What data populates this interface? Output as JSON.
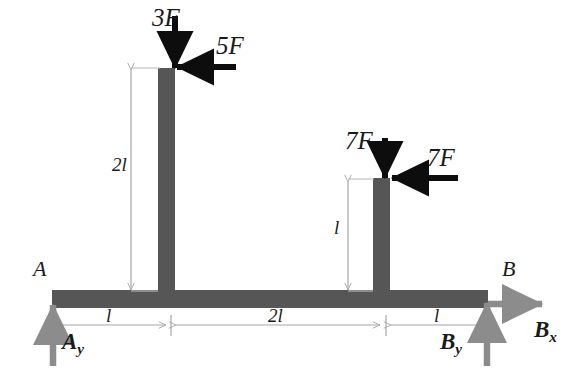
{
  "figure": {
    "type": "statics-free-body-diagram",
    "title": "",
    "colors": {
      "member": "#565656",
      "applied_load_arrow": "#0d0d0d",
      "reaction_arrow": "#8c8c8c",
      "dimension_line": "#a6a6a6",
      "label_text": "#1a1a1a",
      "background": "#ffffff"
    }
  },
  "members": {
    "horizontal_beam": {
      "name": "horizontal-beam",
      "x": 52,
      "y": 290,
      "width": 436,
      "height": 18
    },
    "left_column": {
      "name": "left-column",
      "x": 158,
      "y": 68,
      "width": 17,
      "height": 222
    },
    "right_column": {
      "name": "right-column",
      "x": 373,
      "y": 178,
      "width": 17,
      "height": 112
    }
  },
  "applied_loads": [
    {
      "id": "load-3F",
      "label": "3F",
      "direction": "down",
      "label_x": 152,
      "label_y": 5,
      "x1": 175,
      "y1": 16,
      "x2": 175,
      "y2": 68
    },
    {
      "id": "load-5F",
      "label": "5F",
      "direction": "left",
      "label_x": 216,
      "label_y": 33,
      "x1": 236,
      "y1": 67,
      "x2": 177,
      "y2": 67
    },
    {
      "id": "load-7F-vertical",
      "label": "7F",
      "direction": "down",
      "label_x": 345,
      "label_y": 128,
      "x1": 385,
      "y1": 138,
      "x2": 385,
      "y2": 178
    },
    {
      "id": "load-7F-horizontal",
      "label": "7F",
      "direction": "left",
      "label_x": 427,
      "label_y": 145,
      "x1": 458,
      "y1": 178,
      "x2": 392,
      "y2": 178
    }
  ],
  "reactions": [
    {
      "id": "reaction-Ay",
      "label": "A",
      "subscript": "y",
      "direction": "up",
      "label_x": 62,
      "label_y": 330,
      "x1": 53,
      "y1": 366,
      "x2": 53,
      "y2": 305
    },
    {
      "id": "reaction-By",
      "label": "B",
      "subscript": "y",
      "direction": "up",
      "label_x": 440,
      "label_y": 330,
      "x1": 487,
      "y1": 366,
      "x2": 487,
      "y2": 303
    },
    {
      "id": "reaction-Bx",
      "label": "B",
      "subscript": "x",
      "direction": "right",
      "label_x": 534,
      "label_y": 318,
      "x1": 488,
      "y1": 304,
      "x2": 542,
      "y2": 304
    }
  ],
  "nodes": [
    {
      "id": "node-A",
      "label": "A",
      "x": 33,
      "y": 258
    },
    {
      "id": "node-B",
      "label": "B",
      "x": 502,
      "y": 258
    }
  ],
  "dimensions": [
    {
      "id": "dim-vertical-2l",
      "label": "2l",
      "orientation": "vertical",
      "line_x": 131,
      "y1": 70,
      "y2": 290,
      "label_x": 112,
      "label_y": 155,
      "ext1_x1": 131,
      "ext1_y1": 68,
      "ext1_x2": 160,
      "ext1_y2": 68,
      "ext2_x1": 131,
      "ext2_y1": 291,
      "ext2_x2": 158,
      "ext2_y2": 291
    },
    {
      "id": "dim-vertical-l",
      "label": "l",
      "orientation": "vertical",
      "line_x": 348,
      "y1": 182,
      "y2": 290,
      "label_x": 334,
      "label_y": 218,
      "ext1_x1": 348,
      "ext1_y1": 179,
      "ext1_x2": 374,
      "ext1_y2": 179,
      "ext2_x1": 348,
      "ext2_y1": 291,
      "ext2_x2": 373,
      "ext2_y2": 291
    },
    {
      "id": "dim-horizontal-l-left",
      "label": "l",
      "orientation": "horizontal",
      "line_y": 325,
      "x1": 55,
      "x2": 166,
      "label_x": 106,
      "label_y": 306
    },
    {
      "id": "dim-horizontal-2l",
      "label": "2l",
      "orientation": "horizontal",
      "line_y": 325,
      "x1": 176,
      "x2": 380,
      "label_x": 268,
      "label_y": 306
    },
    {
      "id": "dim-horizontal-l-right",
      "label": "l",
      "orientation": "horizontal",
      "line_y": 325,
      "x1": 391,
      "x2": 485,
      "label_x": 434,
      "label_y": 306
    }
  ],
  "dimension_ticks": [
    {
      "id": "tick-left",
      "x": 171,
      "y1": 315,
      "y2": 336
    },
    {
      "id": "tick-right",
      "x": 386,
      "y1": 315,
      "y2": 336
    }
  ],
  "chart_data": {
    "type": "diagram",
    "span_segments": [
      "l",
      "2l",
      "l"
    ],
    "column_heights": [
      "2l",
      "l"
    ],
    "loads": [
      {
        "name": "3F",
        "sense": "downward",
        "location": "top of left column"
      },
      {
        "name": "5F",
        "sense": "leftward",
        "location": "top of left column"
      },
      {
        "name": "7F",
        "sense": "downward",
        "location": "top of right column"
      },
      {
        "name": "7F",
        "sense": "leftward",
        "location": "top of right column"
      }
    ],
    "support_reactions": [
      {
        "name": "Ay",
        "sense": "upward",
        "location": "A"
      },
      {
        "name": "By",
        "sense": "upward",
        "location": "B"
      },
      {
        "name": "Bx",
        "sense": "rightward",
        "location": "B"
      }
    ]
  }
}
